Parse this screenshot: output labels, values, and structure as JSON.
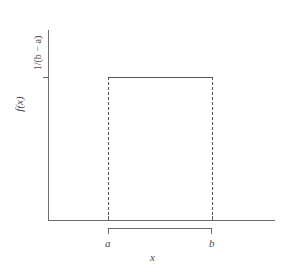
{
  "chart_data": {
    "type": "area",
    "title": "",
    "xlabel": "x",
    "ylabel": "f(x)",
    "grid": false,
    "legend": false,
    "xlim_labels": [
      "a",
      "b"
    ],
    "ylim_labels": [
      "0",
      "1/(b − a)"
    ],
    "categories": [
      "a",
      "b"
    ],
    "x": [
      "a",
      "b"
    ],
    "values": [
      "1/(b − a)",
      "1/(b − a)"
    ],
    "series": [
      {
        "name": "uniform pdf",
        "points": [
          {
            "x": "a",
            "y": "1/(b − a)"
          },
          {
            "x": "b",
            "y": "1/(b − a)"
          }
        ]
      }
    ],
    "annotations": [
      {
        "name": "height-tick-label",
        "text": "1/(b − a)"
      },
      {
        "name": "lower-bound-label",
        "text": "a"
      },
      {
        "name": "upper-bound-label",
        "text": "b"
      },
      {
        "name": "support-bracket",
        "text": ""
      }
    ]
  },
  "axes": {
    "y_title": "f(x)",
    "y_tick_label": "1/(b − a)",
    "y_tick_label_numerator": "1/(",
    "x_title": "x",
    "x_tick_labels": {
      "lower": "a",
      "upper": "b"
    }
  },
  "colors": {
    "axis": "#6b6b6b",
    "curve": "#555555",
    "dashed": "#555555",
    "text": "#4a4a4a",
    "background": "#ffffff"
  }
}
